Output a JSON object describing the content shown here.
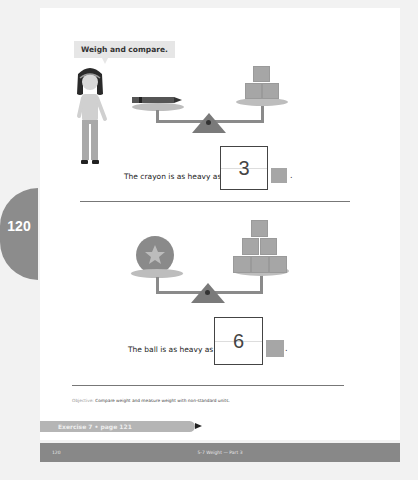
{
  "page": {
    "number_tab": "120",
    "speech_bubble": "Weigh and compare.",
    "problems": [
      {
        "sentence": "The crayon is as heavy as",
        "answer": "3",
        "unit_icon": "cube-icon",
        "period": ".",
        "left_item": "crayon",
        "right_cubes": 3
      },
      {
        "sentence": "The ball is as heavy as",
        "answer": "6",
        "unit_icon": "cube-icon",
        "period": ".",
        "left_item": "ball-with-star",
        "right_cubes": 6
      }
    ],
    "objective_label": "Objective:",
    "objective_text": "Compare weight and measure weight with non-standard units.",
    "exercise_link": "Exercise 7 • page 121",
    "footer": {
      "page_number": "120",
      "title": "5-7 Weight — Part 3"
    }
  },
  "colors": {
    "tab": "#8c8c8c",
    "footer_bar": "#888888",
    "exercise_bar": "#b5b5b5",
    "cube": "#a6a6a6",
    "plate": "#bdbdbd"
  }
}
